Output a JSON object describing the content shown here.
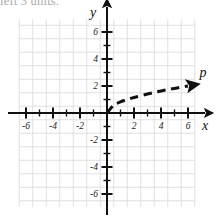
{
  "figure": {
    "clipped_caption": "left 3 units.",
    "background_color": "#ffffff",
    "axis_color": "#111111",
    "grid_color": "#d8d8d8",
    "curve_color": "#111111"
  },
  "axes": {
    "x_axis_label": "x",
    "y_axis_label": "y",
    "x_tick_labels": [
      "-6",
      "-4",
      "-2",
      "2",
      "4",
      "6"
    ],
    "y_tick_labels": [
      "6",
      "4",
      "2",
      "-2",
      "-4",
      "-6"
    ]
  },
  "curve": {
    "label": "p",
    "arrowhead": "arrow-right-icon"
  },
  "chart_data": {
    "type": "line",
    "title": "",
    "xlabel": "x",
    "ylabel": "y",
    "xlim": [
      -7,
      7
    ],
    "ylim": [
      -7,
      7
    ],
    "grid": true,
    "xticks": [
      -6,
      -4,
      -2,
      2,
      4,
      6
    ],
    "yticks": [
      -6,
      -4,
      -2,
      2,
      4,
      6
    ],
    "legend": "none",
    "series": [
      {
        "name": "p",
        "style": "dashed",
        "arrow_end": true,
        "x": [
          0,
          0.5,
          1,
          1.5,
          2,
          3,
          4,
          5,
          6
        ],
        "y": [
          0,
          0.58,
          0.82,
          1.0,
          1.15,
          1.41,
          1.63,
          1.82,
          2.0
        ],
        "description": "Concave-down increasing curve starting at the origin and rising to approximately (6, 2), drawn as a thick dashed curve ending in an arrowhead."
      }
    ],
    "annotations": [
      {
        "text": "p",
        "x": 6.8,
        "y": 2.3
      }
    ]
  }
}
